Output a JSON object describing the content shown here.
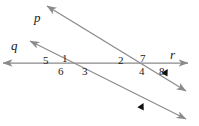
{
  "figure": {
    "width": 199,
    "height": 126,
    "background_color": "#ffffff",
    "line_color": "#8a8a8a",
    "text_color": "#1a1a1a",
    "tick_color": "#111111"
  },
  "lines": [
    {
      "id": "p",
      "label": "p",
      "label_x": 34,
      "label_y": 11,
      "x1": 47,
      "y1": 6,
      "x2": 186,
      "y2": 91,
      "arrow_start": true,
      "arrow_end": true
    },
    {
      "id": "q",
      "label": "q",
      "label_x": 11,
      "label_y": 39,
      "x1": 30,
      "y1": 41,
      "x2": 186,
      "y2": 119,
      "arrow_start": true,
      "arrow_end": true
    },
    {
      "id": "r",
      "label": "r",
      "label_x": 170,
      "label_y": 48,
      "x1": 3,
      "y1": 63,
      "x2": 188,
      "y2": 63,
      "arrow_start": true,
      "arrow_end": true
    }
  ],
  "intersections": [
    {
      "id": "left",
      "x": 65,
      "y": 63
    },
    {
      "id": "right",
      "x": 143,
      "y": 63
    }
  ],
  "angle_labels": [
    {
      "text": "5",
      "x": 43,
      "y": 55
    },
    {
      "text": "1",
      "x": 62,
      "y": 53
    },
    {
      "text": "6",
      "x": 58,
      "y": 66
    },
    {
      "text": "3",
      "x": 82,
      "y": 66
    },
    {
      "text": "2",
      "x": 118,
      "y": 55
    },
    {
      "text": "7",
      "x": 140,
      "y": 53
    },
    {
      "text": "4",
      "x": 139,
      "y": 66
    },
    {
      "text": "8",
      "x": 159,
      "y": 66
    }
  ],
  "tick_marks": [
    {
      "id": "tick-on-p",
      "x": 166,
      "y": 72,
      "rotation": 31
    },
    {
      "id": "tick-on-q",
      "x": 142,
      "y": 106,
      "rotation": 27
    }
  ]
}
